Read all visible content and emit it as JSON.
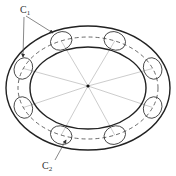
{
  "diagram": {
    "type": "torus-with-cross-sections",
    "labels": {
      "c1": {
        "main": "C",
        "sub": "1"
      },
      "c2": {
        "main": "C",
        "sub": "2"
      }
    },
    "cross_section_count": 8,
    "colors": {
      "outline": "#222222",
      "radial": "#aaaaaa",
      "dashed": "#444444",
      "arrow": "#555555"
    }
  }
}
